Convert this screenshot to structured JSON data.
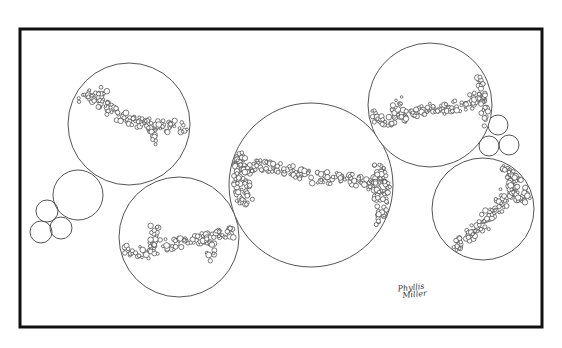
{
  "artwork": {
    "title": "Circles with bubble strands",
    "signature": {
      "line1": "Phyllis",
      "line2": "Miller"
    },
    "colors": {
      "stroke": "#444444",
      "frame": "#111111",
      "background": "#ffffff"
    },
    "large_circles": [
      {
        "name": "circle-top-left",
        "strand": [
          [
            72,
            100
          ],
          [
            90,
            95
          ],
          [
            110,
            110
          ],
          [
            135,
            122
          ],
          [
            160,
            126
          ],
          [
            188,
            127
          ]
        ],
        "spur": [
          [
            150,
            128
          ],
          [
            157,
            144
          ]
        ],
        "spur_top": [
          [
            100,
            100
          ],
          [
            104,
            86
          ]
        ]
      },
      {
        "name": "circle-bottom-left",
        "strand": [
          [
            122,
            248
          ],
          [
            140,
            255
          ],
          [
            160,
            245
          ],
          [
            180,
            243
          ],
          [
            205,
            238
          ],
          [
            236,
            232
          ]
        ],
        "spur": [
          [
            153,
            245
          ],
          [
            155,
            222
          ]
        ],
        "spur2": [
          [
            210,
            240
          ],
          [
            211,
            260
          ]
        ]
      },
      {
        "name": "circle-center-large",
        "strand": [
          [
            232,
            160
          ],
          [
            240,
            170
          ],
          [
            262,
            165
          ],
          [
            290,
            170
          ],
          [
            315,
            178
          ],
          [
            345,
            178
          ],
          [
            375,
            185
          ],
          [
            390,
            190
          ]
        ],
        "fill_left": [
          [
            235,
            145
          ],
          [
            245,
            205
          ]
        ],
        "fill_right": [
          [
            380,
            170
          ],
          [
            385,
            232
          ]
        ]
      },
      {
        "name": "circle-top-right",
        "strand": [
          [
            370,
            115
          ],
          [
            385,
            120
          ],
          [
            400,
            118
          ],
          [
            420,
            110
          ],
          [
            445,
            108
          ],
          [
            470,
            103
          ],
          [
            490,
            92
          ]
        ],
        "spur": [
          [
            393,
            113
          ],
          [
            400,
            98
          ]
        ],
        "fill_right": [
          [
            485,
            80
          ],
          [
            490,
            125
          ]
        ]
      },
      {
        "name": "circle-bottom-right",
        "strand": [
          [
            436,
            240
          ],
          [
            455,
            248
          ],
          [
            470,
            235
          ],
          [
            485,
            222
          ],
          [
            500,
            205
          ],
          [
            512,
            185
          ],
          [
            520,
            170
          ]
        ],
        "fill_right": [
          [
            508,
            165
          ],
          [
            525,
            205
          ]
        ]
      }
    ]
  }
}
